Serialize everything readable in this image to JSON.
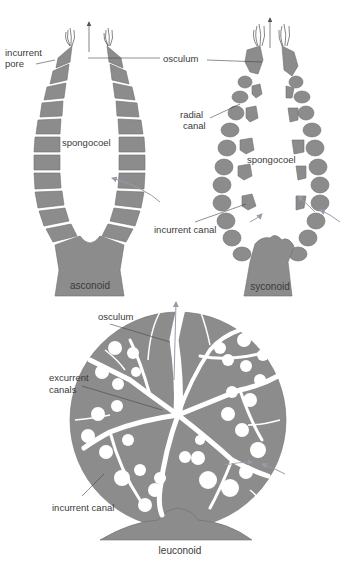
{
  "colors": {
    "tissue": "#8c8c8c",
    "tissue_stroke": "#6e6e6e",
    "background": "#ffffff",
    "flow_arrow": "#9a9aa8",
    "leader_line": "#444444",
    "text": "#3a3a3a"
  },
  "asconoid": {
    "caption": "asconoid",
    "labels": {
      "incurrent_pore_1": "incurrent",
      "incurrent_pore_2": "pore",
      "spongocoel": "spongocoel"
    }
  },
  "syconoid": {
    "caption": "syconoid",
    "labels": {
      "osculum": "osculum",
      "radial_canal_1": "radial",
      "radial_canal_2": "canal",
      "spongocoel": "spongocoel",
      "incurrent_canal": "incurrent canal"
    }
  },
  "leuconoid": {
    "caption": "leuconoid",
    "labels": {
      "osculum": "osculum",
      "excurrent_canals_1": "excurrent",
      "excurrent_canals_2": "canals",
      "incurrent_canal": "incurrent canal"
    }
  }
}
